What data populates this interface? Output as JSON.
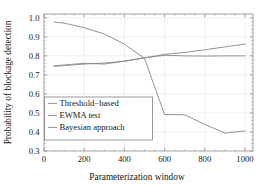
{
  "chart_data": {
    "type": "line",
    "title": "",
    "xlabel": "Parameterization window",
    "ylabel": "Probability of blockage detection",
    "xlim": [
      0,
      1040
    ],
    "ylim": [
      0.3,
      1.02
    ],
    "grid": true,
    "legend_position": "lower-left",
    "xticks": [
      0,
      200,
      400,
      600,
      800,
      1000
    ],
    "xtick_labels": [
      "0",
      "200",
      "400",
      "600",
      "800",
      "1000"
    ],
    "yticks": [
      0.3,
      0.4,
      0.5,
      0.6,
      0.7,
      0.8,
      0.9,
      1.0
    ],
    "ytick_labels": [
      "0.3",
      "0.4",
      "0.5",
      "0.6",
      "0.7",
      "0.8",
      "0.9",
      "1.0"
    ],
    "x": [
      50,
      100,
      200,
      300,
      400,
      500,
      600,
      700,
      800,
      900,
      1000
    ],
    "series": [
      {
        "name": "Threshold−based",
        "color": "#8c8c8c",
        "values": [
          0.978,
          0.972,
          0.948,
          0.915,
          0.862,
          0.787,
          0.492,
          0.49,
          0.44,
          0.394,
          0.405
        ]
      },
      {
        "name": "EWMA test",
        "color": "#8c8c8c",
        "values": [
          0.745,
          0.749,
          0.757,
          0.762,
          0.772,
          0.789,
          0.808,
          0.818,
          0.832,
          0.847,
          0.862
        ]
      },
      {
        "name": "Bayesian approach",
        "color": "#8c8c8c",
        "values": [
          0.747,
          0.752,
          0.761,
          0.757,
          0.772,
          0.79,
          0.803,
          0.8,
          0.799,
          0.8,
          0.8
        ]
      }
    ]
  },
  "legend": {
    "entries": [
      {
        "label": "Threshold−based"
      },
      {
        "label": "EWMA test"
      },
      {
        "label": "Bayesian approach"
      }
    ]
  }
}
